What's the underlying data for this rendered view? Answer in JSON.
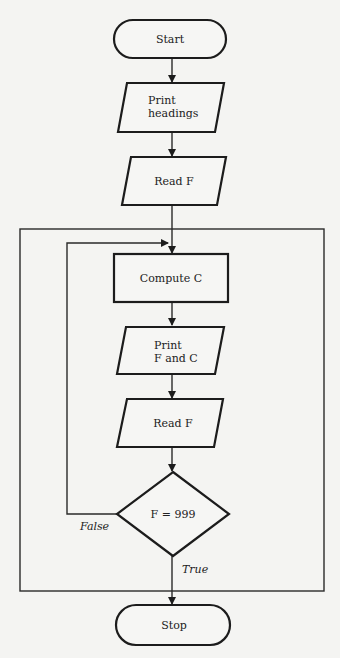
{
  "diagram": {
    "type": "flowchart",
    "nodes": {
      "start": {
        "label": "Start",
        "shape": "terminal"
      },
      "print_headings": {
        "line1": "Print",
        "line2": "headings",
        "shape": "parallelogram"
      },
      "read_f_1": {
        "label": "Read F",
        "shape": "parallelogram"
      },
      "compute_c": {
        "label": "Compute C",
        "shape": "rectangle"
      },
      "print_f_c": {
        "line1": "Print",
        "line2": "F and C",
        "shape": "parallelogram"
      },
      "read_f_2": {
        "label": "Read F",
        "shape": "parallelogram"
      },
      "decision": {
        "label": "F = 999",
        "shape": "diamond"
      },
      "stop": {
        "label": "Stop",
        "shape": "terminal"
      }
    },
    "edge_labels": {
      "false": "False",
      "true": "True"
    },
    "colors": {
      "stroke": "#1c1c1c",
      "background": "#f4f4f2"
    }
  }
}
